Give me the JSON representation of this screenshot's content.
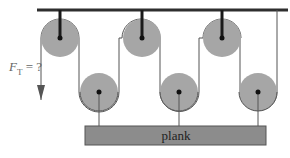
{
  "diagram": {
    "type": "pulley-system",
    "colors": {
      "background": "#ffffff",
      "ceiling": "#2e2e2e",
      "pulley_fill": "#a6a6a6",
      "rope": "#555555",
      "axle": "#111111",
      "plank_fill": "#8c8c8c",
      "plank_stroke": "#555555",
      "label": "#555555"
    },
    "force_label": {
      "symbol": "F",
      "subscript": "T",
      "suffix": " = ?"
    },
    "plank": {
      "label": "plank"
    },
    "top_pulleys": [
      {
        "cx": 60,
        "cy": 38,
        "r": 19
      },
      {
        "cx": 142,
        "cy": 38,
        "r": 19
      },
      {
        "cx": 222,
        "cy": 38,
        "r": 19
      }
    ],
    "bottom_pulleys": [
      {
        "cx": 99,
        "cy": 92,
        "r": 19
      },
      {
        "cx": 179,
        "cy": 92,
        "r": 19
      },
      {
        "cx": 258,
        "cy": 92,
        "r": 19
      }
    ]
  }
}
